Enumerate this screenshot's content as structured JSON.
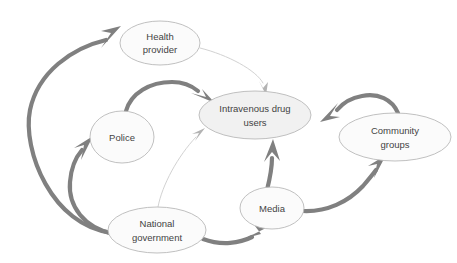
{
  "diagram": {
    "canvas": {
      "width": 457,
      "height": 263,
      "background": "#ffffff"
    },
    "colors": {
      "node_fill": "#fbfbfb",
      "node_fill_highlight": "#f1f1f1",
      "node_stroke": "#b9b9b9",
      "label_text": "#434343",
      "edge_strong": "#808080",
      "edge_weak": "#d2d2d2"
    },
    "nodes": [
      {
        "id": "health-provider",
        "label_lines": [
          "Health",
          "provider"
        ],
        "cx": 160,
        "cy": 43,
        "rx": 40,
        "ry": 22,
        "emphasis": "normal"
      },
      {
        "id": "intravenous-drug-users",
        "label_lines": [
          "Intravenous drug",
          "users"
        ],
        "cx": 255,
        "cy": 115,
        "rx": 56,
        "ry": 24,
        "emphasis": "highlight"
      },
      {
        "id": "police",
        "label_lines": [
          "Police"
        ],
        "cx": 122,
        "cy": 137,
        "rx": 32,
        "ry": 26,
        "emphasis": "normal"
      },
      {
        "id": "community-groups",
        "label_lines": [
          "Community",
          "groups"
        ],
        "cx": 395,
        "cy": 137,
        "rx": 56,
        "ry": 24,
        "emphasis": "normal"
      },
      {
        "id": "media",
        "label_lines": [
          "Media"
        ],
        "cx": 272,
        "cy": 208,
        "rx": 32,
        "ry": 21,
        "emphasis": "normal"
      },
      {
        "id": "national-government",
        "label_lines": [
          "National",
          "government"
        ],
        "cx": 157,
        "cy": 230,
        "rx": 49,
        "ry": 23,
        "emphasis": "normal"
      }
    ],
    "edges": [
      {
        "id": "natgov-to-healthprovider",
        "from": "national-government",
        "to": "health-provider",
        "weight": "strong"
      },
      {
        "id": "natgov-to-police",
        "from": "national-government",
        "to": "police",
        "weight": "strong"
      },
      {
        "id": "natgov-to-media",
        "from": "national-government",
        "to": "media",
        "weight": "strong"
      },
      {
        "id": "natgov-to-intravenous-drug-users",
        "from": "national-government",
        "to": "intravenous-drug-users",
        "weight": "weak"
      },
      {
        "id": "police-to-intravenous-drug-users",
        "from": "police",
        "to": "intravenous-drug-users",
        "weight": "strong"
      },
      {
        "id": "healthprovider-to-intravenous-drug-users",
        "from": "health-provider",
        "to": "intravenous-drug-users",
        "weight": "weak"
      },
      {
        "id": "media-to-intravenous-drug-users",
        "from": "media",
        "to": "intravenous-drug-users",
        "weight": "strong"
      },
      {
        "id": "media-to-community-groups",
        "from": "media",
        "to": "community-groups",
        "weight": "strong"
      },
      {
        "id": "communitygroups-to-intravenous-drug-users",
        "from": "community-groups",
        "to": "intravenous-drug-users",
        "weight": "strong"
      }
    ]
  }
}
